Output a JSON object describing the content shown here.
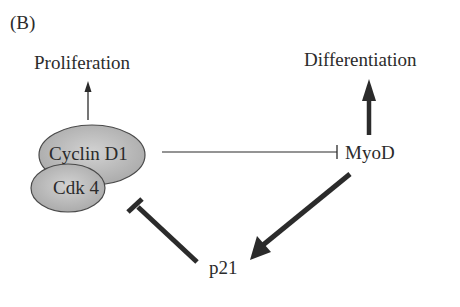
{
  "panel_label": "(B)",
  "nodes": {
    "proliferation": "Proliferation",
    "differentiation": "Differentiation",
    "cyclin_d1": "Cyclin D1",
    "cdk4": "Cdk 4",
    "myod": "MyoD",
    "p21": "p21"
  },
  "edges": [
    {
      "from": "Cyclin D1/Cdk 4",
      "to": "Proliferation",
      "type": "activation",
      "weight": "thin"
    },
    {
      "from": "MyoD",
      "to": "Differentiation",
      "type": "activation",
      "weight": "thick"
    },
    {
      "from": "Cyclin D1/Cdk 4",
      "to": "MyoD",
      "type": "inhibition",
      "weight": "thin"
    },
    {
      "from": "MyoD",
      "to": "p21",
      "type": "activation",
      "weight": "thick"
    },
    {
      "from": "p21",
      "to": "Cyclin D1/Cdk 4",
      "type": "inhibition",
      "weight": "thick"
    }
  ],
  "colors": {
    "ellipse_fill": "#b8b8b8",
    "ellipse_stroke": "#4a4a4a",
    "line": "#2b2b2b",
    "text": "#2b2b2b"
  }
}
